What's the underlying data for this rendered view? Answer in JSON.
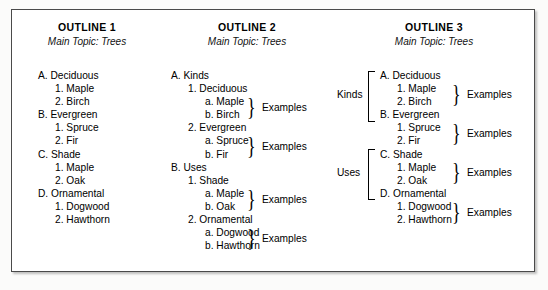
{
  "figure": {
    "background_color": "#fbfbfa",
    "frame_color": "#4a4a4a",
    "text_color": "#000000"
  },
  "outlines": [
    {
      "id": "outline-1",
      "title": "OUTLINE 1",
      "subtitle": "Main Topic: Trees",
      "lines": [
        {
          "marker": "A.",
          "text": "Deciduous",
          "level": 1
        },
        {
          "marker": "1.",
          "text": "Maple",
          "level": 2
        },
        {
          "marker": "2.",
          "text": "Birch",
          "level": 2
        },
        {
          "marker": "B.",
          "text": "Evergreen",
          "level": 1
        },
        {
          "marker": "1.",
          "text": "Spruce",
          "level": 2
        },
        {
          "marker": "2.",
          "text": "Fir",
          "level": 2
        },
        {
          "marker": "C.",
          "text": "Shade",
          "level": 1
        },
        {
          "marker": "1.",
          "text": "Maple",
          "level": 2
        },
        {
          "marker": "2.",
          "text": "Oak",
          "level": 2
        },
        {
          "marker": "D.",
          "text": "Ornamental",
          "level": 1
        },
        {
          "marker": "1.",
          "text": "Dogwood",
          "level": 2
        },
        {
          "marker": "2.",
          "text": "Hawthorn",
          "level": 2
        }
      ],
      "braces": [],
      "group_brackets": []
    },
    {
      "id": "outline-2",
      "title": "OUTLINE 2",
      "subtitle": "Main Topic: Trees",
      "lines": [
        {
          "marker": "A.",
          "text": "Kinds",
          "level": 1
        },
        {
          "marker": "1.",
          "text": "Deciduous",
          "level": 2
        },
        {
          "marker": "a.",
          "text": "Maple",
          "level": 3
        },
        {
          "marker": "b.",
          "text": "Birch",
          "level": 3
        },
        {
          "marker": "2.",
          "text": "Evergreen",
          "level": 2
        },
        {
          "marker": "a.",
          "text": "Spruce",
          "level": 3
        },
        {
          "marker": "b.",
          "text": "Fir",
          "level": 3
        },
        {
          "marker": "B.",
          "text": "Uses",
          "level": 1
        },
        {
          "marker": "1.",
          "text": "Shade",
          "level": 2
        },
        {
          "marker": "a.",
          "text": "Maple",
          "level": 3
        },
        {
          "marker": "b.",
          "text": "Oak",
          "level": 3
        },
        {
          "marker": "2.",
          "text": "Ornamental",
          "level": 2
        },
        {
          "marker": "a.",
          "text": "Dogwood",
          "level": 3
        },
        {
          "marker": "b.",
          "text": "Hawthorn",
          "level": 3
        }
      ],
      "braces": [
        {
          "label": "Examples",
          "start_line": 2,
          "end_line": 3
        },
        {
          "label": "Examples",
          "start_line": 5,
          "end_line": 6
        },
        {
          "label": "Examples",
          "start_line": 9,
          "end_line": 10
        },
        {
          "label": "Examples",
          "start_line": 12,
          "end_line": 13
        }
      ],
      "group_brackets": []
    },
    {
      "id": "outline-3",
      "title": "OUTLINE 3",
      "subtitle": "Main Topic: Trees",
      "lines": [
        {
          "marker": "A.",
          "text": "Deciduous",
          "level": 1
        },
        {
          "marker": "1.",
          "text": "Maple",
          "level": 2
        },
        {
          "marker": "2.",
          "text": "Birch",
          "level": 2
        },
        {
          "marker": "B.",
          "text": "Evergreen",
          "level": 1
        },
        {
          "marker": "1.",
          "text": "Spruce",
          "level": 2
        },
        {
          "marker": "2.",
          "text": "Fir",
          "level": 2
        },
        {
          "marker": "C.",
          "text": "Shade",
          "level": 1
        },
        {
          "marker": "1.",
          "text": "Maple",
          "level": 2
        },
        {
          "marker": "2.",
          "text": "Oak",
          "level": 2
        },
        {
          "marker": "D.",
          "text": "Ornamental",
          "level": 1
        },
        {
          "marker": "1.",
          "text": "Dogwood",
          "level": 2
        },
        {
          "marker": "2.",
          "text": "Hawthorn",
          "level": 2
        }
      ],
      "braces": [
        {
          "label": "Examples",
          "start_line": 1,
          "end_line": 2
        },
        {
          "label": "Examples",
          "start_line": 4,
          "end_line": 5
        },
        {
          "label": "Examples",
          "start_line": 7,
          "end_line": 8
        },
        {
          "label": "Examples",
          "start_line": 10,
          "end_line": 11
        }
      ],
      "group_brackets": [
        {
          "label": "Kinds",
          "start_line": 0,
          "end_line": 3
        },
        {
          "label": "Uses",
          "start_line": 6,
          "end_line": 9
        }
      ]
    }
  ]
}
